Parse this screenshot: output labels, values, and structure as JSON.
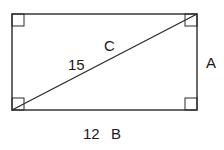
{
  "diagram": {
    "type": "rectangle-with-diagonal",
    "colors": {
      "stroke": "#2a2a2a",
      "text": "#1a1a1a",
      "background": "#ffffff"
    },
    "rectangle": {
      "x": 12,
      "y": 14,
      "width": 185,
      "height": 96
    },
    "right_angle_markers": [
      "top-left",
      "top-right",
      "bottom-left",
      "bottom-right"
    ],
    "labels": {
      "diagonal_letter": "C",
      "diagonal_length": "15",
      "height_letter": "A",
      "base_length": "12",
      "base_letter": "B"
    }
  }
}
